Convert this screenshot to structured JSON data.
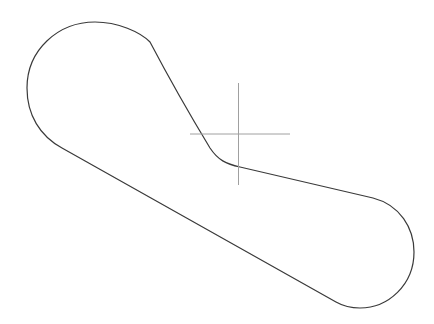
{
  "canvas": {
    "width": 434,
    "height": 324,
    "background": "#ffffff"
  },
  "shape": {
    "type": "rounded-outline",
    "stroke": "#3a3a3a",
    "stroke_width": 1.2,
    "path": "M 150 42 C 170 80 190 115 210 148 C 218 160 226 164 240 167 L 373 198 C 400 205 414 228 414 252 C 414 285 388 308 360 308 C 350 308 343 306 336 302 L 62 148 C 40 136 27 115 27 88 C 27 50 58 22 95 22 C 118 22 140 32 150 42 Z"
  },
  "crosshair": {
    "stroke": "#a0a0a0",
    "stroke_width": 1,
    "center_x": 238.5,
    "center_y": 134,
    "horizontal": {
      "x1": 190,
      "x2": 290
    },
    "vertical": {
      "y1": 83,
      "y2": 185
    }
  }
}
